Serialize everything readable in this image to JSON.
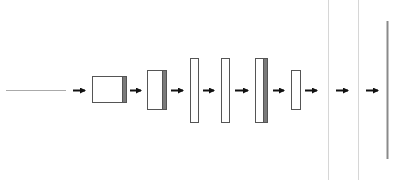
{
  "diagram": {
    "type": "neural-network-layer-flow",
    "colors": {
      "background": "#ffffff",
      "box_stroke": "#555555",
      "box_fill": "#ffffff",
      "strip_fill": "#7a7a7a",
      "arrow": "#111111",
      "input_line": "#aaaaaa",
      "light_divider": "#d6d6d6",
      "output_line": "#8a8a8a"
    },
    "input_line": {
      "x1": 6,
      "x2": 66,
      "y": 90
    },
    "blocks": [
      {
        "id": "block-1",
        "x": 92,
        "y": 76,
        "w": 34,
        "h": 26,
        "strip_w": 4
      },
      {
        "id": "block-2",
        "x": 147,
        "y": 70,
        "w": 19,
        "h": 39,
        "strip_w": 4
      },
      {
        "id": "block-3",
        "x": 190,
        "y": 58,
        "w": 8,
        "h": 64,
        "strip_w": 0
      },
      {
        "id": "block-4",
        "x": 221,
        "y": 58,
        "w": 8,
        "h": 64,
        "strip_w": 0
      },
      {
        "id": "block-5",
        "x": 255,
        "y": 58,
        "w": 12,
        "h": 64,
        "strip_w": 4
      },
      {
        "id": "block-6",
        "x": 291,
        "y": 70,
        "w": 9,
        "h": 39,
        "strip_w": 0
      }
    ],
    "arrows": [
      {
        "x1": 73,
        "x2": 89,
        "y": 90
      },
      {
        "x1": 130,
        "x2": 145,
        "y": 90
      },
      {
        "x1": 171,
        "x2": 187,
        "y": 90
      },
      {
        "x1": 203,
        "x2": 218,
        "y": 90
      },
      {
        "x1": 235,
        "x2": 252,
        "y": 90
      },
      {
        "x1": 273,
        "x2": 288,
        "y": 90
      },
      {
        "x1": 305,
        "x2": 321,
        "y": 90
      },
      {
        "x1": 336,
        "x2": 352,
        "y": 90
      },
      {
        "x1": 366,
        "x2": 382,
        "y": 90
      }
    ],
    "dividers": [
      {
        "x": 328,
        "y1": 0,
        "y2": 180
      },
      {
        "x": 358,
        "y1": 0,
        "y2": 180
      }
    ],
    "output_line": {
      "x": 387,
      "y1": 21,
      "y2": 159
    }
  }
}
